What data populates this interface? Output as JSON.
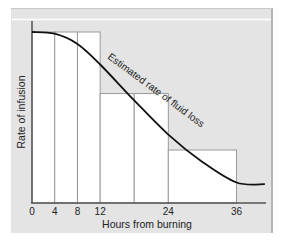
{
  "chart_data": {
    "type": "bar",
    "title": "",
    "xlabel": "Hours from burning",
    "ylabel": "Rate of infusion",
    "x_ticks": [
      0,
      4,
      8,
      12,
      24,
      36
    ],
    "x_range": [
      0,
      41
    ],
    "y_ticks": [],
    "y_axis_numeric_labels_shown": false,
    "grid": false,
    "legend": null,
    "note": "Y-axis has no ticks or numeric labels; heights below are normalized pixel positions (0 = x-axis, 1 = top of first step), not readable data values.",
    "bars": [
      {
        "x_start": 0,
        "x_end": 4,
        "height_normalized": 1.0
      },
      {
        "x_start": 4,
        "x_end": 8,
        "height_normalized": 1.0
      },
      {
        "x_start": 8,
        "x_end": 12,
        "height_normalized": 1.0
      },
      {
        "x_start": 12,
        "x_end": 18,
        "height_normalized": 0.64
      },
      {
        "x_start": 18,
        "x_end": 24,
        "height_normalized": 0.64
      },
      {
        "x_start": 24,
        "x_end": 36,
        "height_normalized": 0.31
      }
    ],
    "series": [
      {
        "name": "Estimated rate of fluid loss",
        "type": "line",
        "points_normalized": [
          [
            0,
            1.0
          ],
          [
            4,
            0.99
          ],
          [
            8,
            0.93
          ],
          [
            12,
            0.81
          ],
          [
            18,
            0.6
          ],
          [
            24,
            0.4
          ],
          [
            30,
            0.24
          ],
          [
            36,
            0.12
          ],
          [
            41,
            0.11
          ]
        ]
      }
    ],
    "annotations": [
      {
        "text": "Estimated rate of fluid loss",
        "placement": "along curve, rotated",
        "near_x": 18
      }
    ]
  },
  "axes": {
    "x_label": "Hours from burning",
    "y_label": "Rate of infusion",
    "x_tick_labels": [
      "0",
      "4",
      "8",
      "12",
      "24",
      "36"
    ]
  },
  "curve_label": "Estimated rate of fluid loss",
  "colors": {
    "panel": "#e4e4e4",
    "bars": "#ffffff",
    "bar_outline": "#9a9a9a",
    "curve": "#111111",
    "axis": "#555555"
  }
}
